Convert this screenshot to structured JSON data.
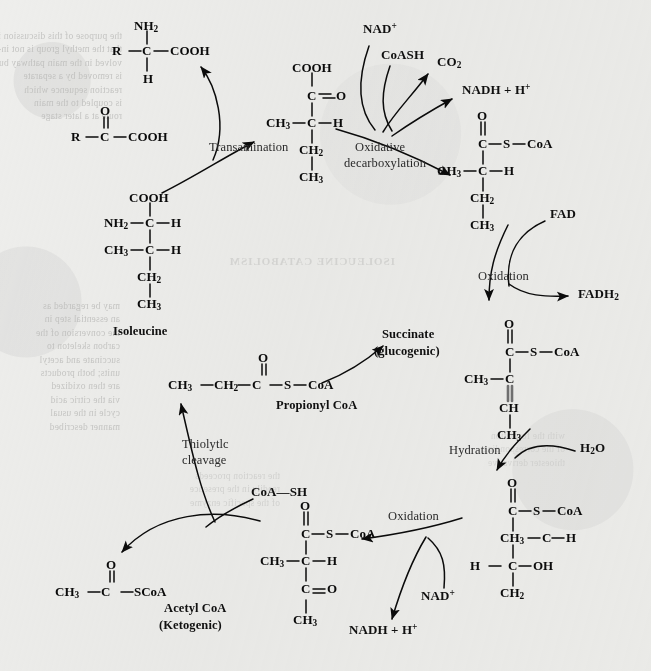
{
  "diagram": {
    "background_color": "#eeeeec",
    "ink_color": "#101010"
  },
  "enzyme_steps": [
    {
      "id": "transamination",
      "label": "Transamination"
    },
    {
      "id": "oxidative-decarb",
      "label_line1": "Oxidative",
      "label_line2": "decarboxylation"
    },
    {
      "id": "oxidation-fad",
      "label": "Oxidation"
    },
    {
      "id": "hydration",
      "label": "Hydration"
    },
    {
      "id": "oxidation-nad",
      "label": "Oxidation"
    },
    {
      "id": "thiolytic",
      "label_line1": "Thiolytlc",
      "label_line2": "cleavage"
    }
  ],
  "cofactors": {
    "nad_plus_top": "NAD",
    "nad_plus_top_sup": "+",
    "coash": "CoASH",
    "co2": "CO",
    "co2_sub": "2",
    "nadh_top": "NADH + H",
    "nadh_top_sup": "+",
    "fad": "FAD",
    "fadh2": "FADH",
    "fadh2_sub": "2",
    "water": "H",
    "water_sub": "2",
    "water_tail": "O",
    "nad_plus_bottom": "NAD",
    "nad_plus_bottom_sup": "+",
    "nadh_bottom": "NADH + H",
    "nadh_bottom_sup": "+",
    "coa_sh": "CoA—SH"
  },
  "metabolite_names": {
    "isoleucine": "Isoleucine",
    "propionyl": "Propionyl CoA",
    "succinate_l1": "Succinate",
    "succinate_l2": "(glucogenic)",
    "acetyl_l1": "Acetyl CoA",
    "acetyl_l2": "(Ketogenic)"
  },
  "structures": {
    "amino_acid_generic": {
      "name": "generic-amino-acid",
      "atoms": [
        "NH",
        "2",
        "R",
        "C",
        "COOH",
        "H"
      ]
    },
    "keto_acid_generic": {
      "name": "generic-keto-acid",
      "atoms": [
        "O",
        "R",
        "C",
        "COOH"
      ]
    },
    "isoleucine": {
      "name": "isoleucine",
      "atoms": [
        "COOH",
        "NH",
        "2",
        "C",
        "H",
        "CH",
        "3",
        "C",
        "H",
        "CH",
        "2",
        "CH",
        "3"
      ]
    },
    "keto_acid_ile": {
      "name": "alpha-keto-beta-methylvalerate",
      "atoms": [
        "COOH",
        "C",
        "O",
        "CH",
        "3",
        "C",
        "H",
        "CH",
        "2",
        "CH",
        "3"
      ]
    },
    "methylbutyryl_coa": {
      "name": "alpha-methylbutyryl-coa",
      "atoms": [
        "O",
        "C",
        "S",
        "CoA",
        "CH",
        "3",
        "C",
        "H",
        "CH",
        "2",
        "CH",
        "3"
      ]
    },
    "tiglyl_coa": {
      "name": "tiglyl-coa",
      "atoms": [
        "O",
        "C",
        "S",
        "CoA",
        "CH",
        "3",
        "C",
        "CH",
        "CH",
        "3"
      ]
    },
    "hydroxy_coa": {
      "name": "alpha-methyl-beta-hydroxybutyryl-coa",
      "atoms": [
        "O",
        "C",
        "S",
        "CoA",
        "CH",
        "3",
        "C",
        "H",
        "H",
        "C",
        "OH",
        "CH",
        "2"
      ]
    },
    "keto_coa": {
      "name": "alpha-methylacetoacetyl-coa",
      "atoms": [
        "O",
        "C",
        "S",
        "CoA",
        "CH",
        "3",
        "C",
        "H",
        "C",
        "O",
        "CH",
        "3"
      ]
    },
    "propionyl_coa": {
      "name": "propionyl-coa",
      "atoms": [
        "O",
        "CH",
        "3",
        "CH",
        "2",
        "C",
        "S",
        "CoA"
      ]
    },
    "acetyl_coa": {
      "name": "acetyl-coa",
      "atoms": [
        "O",
        "CH",
        "3",
        "C",
        "SCoA"
      ]
    }
  },
  "showthrough_text": {
    "left_block": "the purpose of this discussion is\nthat the methyl group is not in-\nvolved in the main pathway but\nis removed by a separate\nreaction sequence which\nis coupled to the main\nroute at a later stage",
    "left_block2": "may be regarded as\nan essential step in\nthe conversion of the\ncarbon skeleton to\nsuccinate and acetyl\nunits; both products\nare then oxidized\nvia the citric acid\ncycle in the usual\nmanner described",
    "mid_block": "the reaction proceeds\nreadily in the presence\nof the specific enzyme",
    "right_block": "with the formation\nof the corresponding\nthioester derivative",
    "header": "ISOLEUCINE CATABOLISM"
  }
}
